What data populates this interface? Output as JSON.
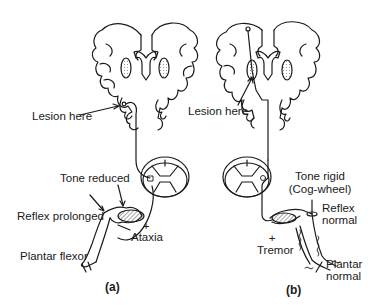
{
  "panels": [
    {
      "id": "a",
      "caption": "(a)",
      "labels": {
        "lesion": "Lesion here",
        "tone": "Tone reduced",
        "reflex": "Reflex prolonged",
        "plantar": "Plantar flexor",
        "plus": "+",
        "sign": "Ataxia"
      }
    },
    {
      "id": "b",
      "caption": "(b)",
      "labels": {
        "lesion": "Lesion here",
        "tone_line1": "Tone rigid",
        "tone_line2": "(Cog-wheel)",
        "reflex_line1": "Reflex",
        "reflex_line2": "normal",
        "plantar_line1": "Plantar",
        "plantar_line2": "normal",
        "plus": "+",
        "sign": "Tremor"
      }
    }
  ],
  "colors": {
    "ink": "#1a1a1a",
    "background": "#ffffff"
  }
}
